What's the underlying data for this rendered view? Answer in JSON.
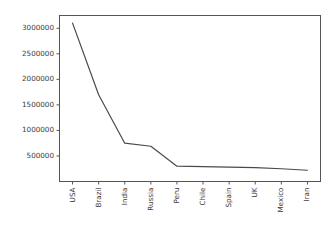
{
  "figure": {
    "background_color": "#ffffff",
    "line_color": "#4a4a4a",
    "axis_color": "#555555",
    "tick_text_color": "#3a3a3a"
  },
  "chart_data": {
    "type": "line",
    "title": "",
    "subtitle": "",
    "xlabel": "",
    "ylabel": "",
    "categories": [
      "USA",
      "Brazil",
      "India",
      "Russia",
      "Peru",
      "Chile",
      "Spain",
      "UK",
      "Mexico",
      "Iran"
    ],
    "values": [
      3100000,
      1700000,
      750000,
      690000,
      300000,
      290000,
      280000,
      270000,
      250000,
      220000
    ],
    "series": [
      {
        "name": "Confirmed cases",
        "values": [
          3100000,
          1700000,
          750000,
          690000,
          300000,
          290000,
          280000,
          270000,
          250000,
          220000
        ]
      }
    ],
    "ylim": [
      0,
      3250000
    ],
    "yticks": [
      500000,
      1000000,
      1500000,
      2000000,
      2500000,
      3000000
    ],
    "ytick_labels": [
      "500000",
      "1000000",
      "1500000",
      "2000000",
      "2500000",
      "3000000"
    ],
    "xtick_labels": [
      "USA",
      "Brazil",
      "India",
      "Russia",
      "Peru",
      "Chile",
      "Spain",
      "UK",
      "Mexico",
      "Iran"
    ],
    "xtick_rotation": -90,
    "grid": false,
    "legend": false,
    "legend_position": "none",
    "markers": false,
    "annotations": []
  }
}
